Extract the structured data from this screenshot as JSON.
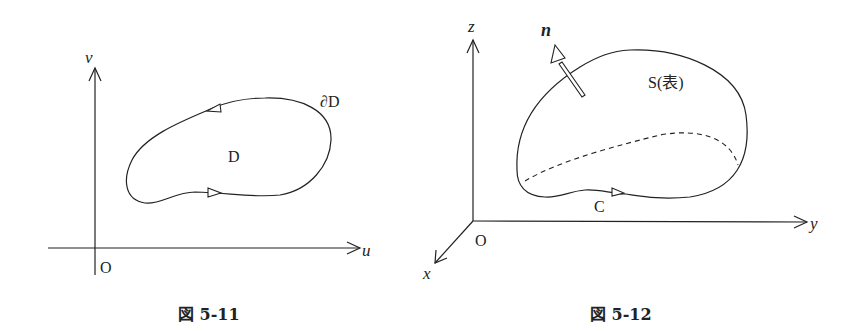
{
  "figures": [
    {
      "id": "fig-5-11",
      "caption": "図 5-11",
      "axes": {
        "horizontal": "u",
        "vertical": "v",
        "origin": "O"
      },
      "region_label": "D",
      "boundary_label": "∂D"
    },
    {
      "id": "fig-5-12",
      "caption": "図 5-12",
      "axes": {
        "x": "x",
        "y": "y",
        "z": "z",
        "origin": "O"
      },
      "surface_label": "S(表)",
      "normal_label": "n",
      "curve_label": "C"
    }
  ],
  "colors": {
    "ink": "#222222",
    "background": "#ffffff"
  }
}
